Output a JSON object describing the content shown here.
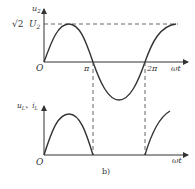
{
  "figure": {
    "caption": "b)",
    "top_plot": {
      "y_axis_label": "u",
      "y_axis_label_sub": "2",
      "peak_label_coef": "√2",
      "peak_label_var": "U",
      "peak_label_sub": "2",
      "origin_label": "O",
      "tick_pi": "π",
      "tick_2pi": "2π",
      "x_axis_label": "ωt",
      "curve": "sine, full period 0 to ~2.4π"
    },
    "bottom_plot": {
      "y_axis_label_1": "u",
      "y_axis_label_1_sub": "L",
      "separator": "、",
      "y_axis_label_2": "i",
      "y_axis_label_2_sub": "L",
      "origin_label": "O",
      "x_axis_label": "ωt",
      "curve": "half-wave rectified sine (positive half-cycles only)"
    },
    "colors": {
      "line": "#333333",
      "dashed": "#555555",
      "background": "#ffffff"
    }
  }
}
